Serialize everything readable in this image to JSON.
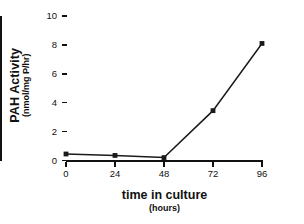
{
  "chart_data": {
    "type": "line",
    "title": "",
    "xlabel": "time in culture",
    "xlabel_units": "(hours)",
    "ylabel": "PAH Activity",
    "ylabel_units": "(nmol/mg P/hr)",
    "x": [
      0,
      24,
      48,
      72,
      96
    ],
    "values": [
      0.45,
      0.35,
      0.2,
      3.45,
      8.1
    ],
    "series": [
      {
        "name": "PAH Activity",
        "values": [
          0.45,
          0.35,
          0.2,
          3.45,
          8.1
        ]
      }
    ],
    "xticks": [
      "0",
      "24",
      "48",
      "72",
      "96"
    ],
    "yticks": [
      "0",
      "2",
      "4",
      "6",
      "8",
      "10"
    ],
    "xlim": [
      0,
      96
    ],
    "ylim": [
      0,
      10
    ],
    "grid": false,
    "legend": false,
    "marker": "square",
    "line_color": "#1a1a1a",
    "marker_color": "#1a1a1a",
    "background": "#ffffff"
  }
}
